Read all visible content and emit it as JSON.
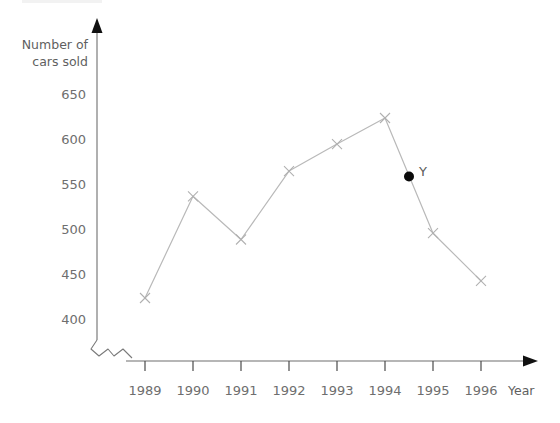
{
  "chart_data": {
    "type": "line",
    "title": "",
    "subtitle": "",
    "xlabel": "Year",
    "ylabel": "Number of cars sold",
    "ylabel_lines": [
      "Number of",
      "cars sold"
    ],
    "categories": [
      "1989",
      "1990",
      "1991",
      "1992",
      "1993",
      "1994",
      "1995",
      "1996"
    ],
    "values": [
      420,
      533,
      485,
      561,
      591,
      620,
      492,
      439
    ],
    "series": [
      {
        "name": "Number of cars sold",
        "values": [
          420,
          533,
          485,
          561,
          591,
          620,
          492,
          439
        ]
      }
    ],
    "y_ticks": [
      400,
      450,
      500,
      550,
      600,
      650
    ],
    "y_tick_labels": [
      "400",
      "450",
      "500",
      "550",
      "600",
      "650"
    ],
    "x_tick_labels": [
      "1989",
      "1990",
      "1991",
      "1992",
      "1993",
      "1994",
      "1995",
      "1996"
    ],
    "ylim": [
      390,
      660
    ],
    "xlim": [
      "1989",
      "1996"
    ],
    "grid": false,
    "legend": "none",
    "axis_break": true,
    "marker_style": "cross",
    "annotations": [
      {
        "label": "Y",
        "x": "1994.5",
        "y": 555,
        "marker": "filled-dot"
      }
    ],
    "colors": {
      "line": "#b9b9b9",
      "marker": "#b0b0b0",
      "axis": "#6f6f6f",
      "text": "#6e6e6e",
      "annotation_point": "#0b0b0b",
      "background": "#ffffff"
    }
  },
  "labels": {
    "y_axis_line1": "Number of",
    "y_axis_line2": "cars sold",
    "y_650": "650",
    "y_600": "600",
    "y_550": "550",
    "y_500": "500",
    "y_450": "450",
    "y_400": "400",
    "x_1989": "1989",
    "x_1990": "1990",
    "x_1991": "1991",
    "x_1992": "1992",
    "x_1993": "1993",
    "x_1994": "1994",
    "x_1995": "1995",
    "x_1996": "1996",
    "x_axis_title": "Year",
    "point_y": "Y"
  }
}
